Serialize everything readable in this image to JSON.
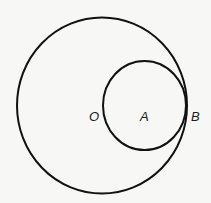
{
  "diagram": {
    "circles": [
      {
        "name": "large-circle",
        "center": "O"
      },
      {
        "name": "small-circle",
        "center": "A"
      }
    ],
    "points": [
      {
        "id": "O",
        "label": "O"
      },
      {
        "id": "A",
        "label": "A"
      },
      {
        "id": "B",
        "label": "B"
      }
    ],
    "tangent_point": "B",
    "stroke_color": "#111111",
    "background_color": "#f7f7f5"
  }
}
